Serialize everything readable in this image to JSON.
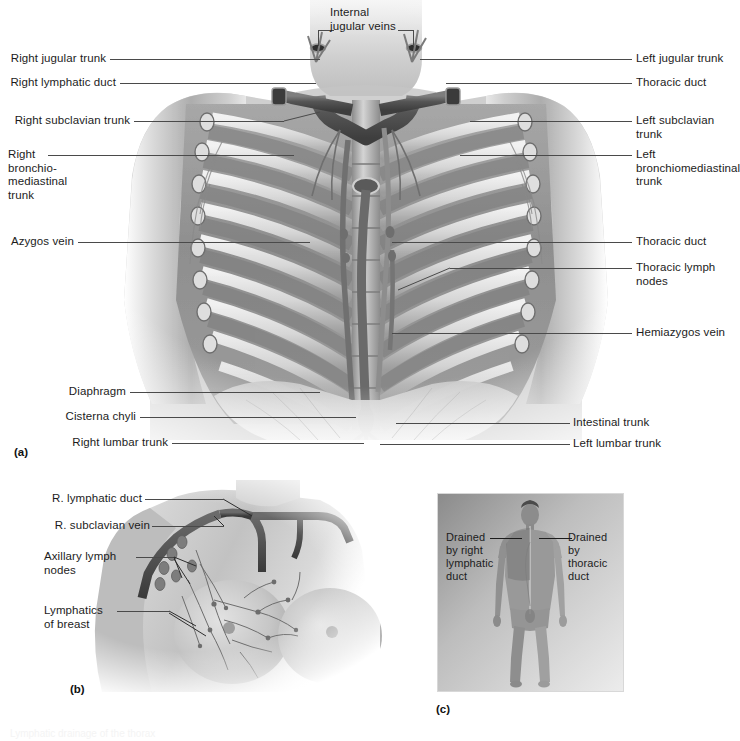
{
  "figure": {
    "title": "Lymphatic drainage of the thorax",
    "panels": [
      {
        "letter": "(a)",
        "name": "thoracic-lymphatic-overview"
      },
      {
        "letter": "(b)",
        "name": "breast-axillary-lymphatics"
      },
      {
        "letter": "(c)",
        "name": "body-drainage-regions"
      }
    ]
  },
  "panel_a": {
    "letter": "(a)",
    "labels_top": [
      {
        "id": "internal-jugular-veins",
        "text": "Internal\njugular veins"
      }
    ],
    "labels_left": [
      {
        "id": "right-jugular-trunk",
        "text": "Right jugular trunk"
      },
      {
        "id": "right-lymphatic-duct",
        "text": "Right lymphatic duct"
      },
      {
        "id": "right-subclavian-trunk",
        "text": "Right subclavian trunk"
      },
      {
        "id": "right-bronchiomediastinal-trunk",
        "text": "Right\nbronchio-\nmediastinal\ntrunk"
      },
      {
        "id": "azygos-vein",
        "text": "Azygos vein"
      },
      {
        "id": "diaphragm",
        "text": "Diaphragm"
      },
      {
        "id": "cisterna-chyli",
        "text": "Cisterna chyli"
      },
      {
        "id": "right-lumbar-trunk",
        "text": "Right lumbar trunk"
      }
    ],
    "labels_right": [
      {
        "id": "left-jugular-trunk",
        "text": "Left jugular trunk"
      },
      {
        "id": "thoracic-duct-upper",
        "text": "Thoracic duct"
      },
      {
        "id": "left-subclavian-trunk",
        "text": "Left subclavian\ntrunk"
      },
      {
        "id": "left-bronchiomediastinal-trunk",
        "text": "Left\nbronchiomediastinal\ntrunk"
      },
      {
        "id": "thoracic-duct-lower",
        "text": "Thoracic duct"
      },
      {
        "id": "thoracic-lymph-nodes",
        "text": "Thoracic lymph\nnodes"
      },
      {
        "id": "hemiazygos-vein",
        "text": "Hemiazygos vein"
      },
      {
        "id": "intestinal-trunk",
        "text": "Intestinal trunk"
      },
      {
        "id": "left-lumbar-trunk",
        "text": "Left lumbar trunk"
      }
    ]
  },
  "panel_b": {
    "letter": "(b)",
    "labels": [
      {
        "id": "r-lymphatic-duct",
        "text": "R. lymphatic duct"
      },
      {
        "id": "r-subclavian-vein",
        "text": "R. subclavian vein"
      },
      {
        "id": "axillary-lymph-nodes",
        "text": "Axillary lymph\nnodes"
      },
      {
        "id": "lymphatics-of-breast",
        "text": "Lymphatics\nof breast"
      }
    ]
  },
  "panel_c": {
    "letter": "(c)",
    "labels": [
      {
        "id": "drained-by-right-lymphatic-duct",
        "text": "Drained\nby right\nlymphatic\nduct"
      },
      {
        "id": "drained-by-thoracic-duct",
        "text": "Drained\nby\nthoracic\nduct"
      }
    ]
  },
  "colors": {
    "label_text": "#1c1c1c",
    "leader_line": "#4a4a4a",
    "vessel_dark": "#6b6b6b",
    "bone_light": "#e2e2e2",
    "muscle_mid": "#9a9a9a",
    "skin_mid": "#b9b9b9"
  }
}
